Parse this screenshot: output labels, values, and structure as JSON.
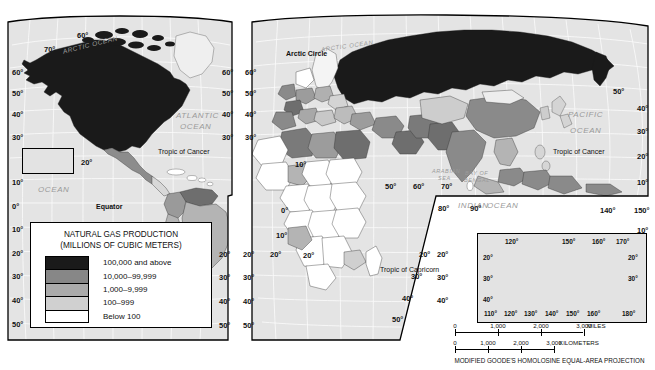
{
  "map": {
    "title": "NATURAL GAS PRODUCTION",
    "projection_note": "MODIFIED GOODE'S HOMOLOSINE EQUAL-AREA PROJECTION"
  },
  "legend": {
    "title": "NATURAL GAS PRODUCTION",
    "subtitle": "(MILLIONS OF CUBIC METERS)",
    "classes": [
      {
        "label": "100,000 and above",
        "color": "#1a1a1a"
      },
      {
        "label": "10,000–99,999",
        "color": "#878787"
      },
      {
        "label": "1,000–9,999",
        "color": "#ababab"
      },
      {
        "label": "100–999",
        "color": "#d0d0d0"
      },
      {
        "label": "Below 100",
        "color": "#ffffff"
      }
    ]
  },
  "scale": {
    "miles_ticks": [
      "0",
      "1,000",
      "2,000",
      "3,000"
    ],
    "miles_unit": "MILES",
    "km_ticks": [
      "0",
      "1,000",
      "2,000",
      "3,000"
    ],
    "km_unit": "KILOMETERS"
  },
  "ocean_labels": [
    {
      "text": "ARCTIC OCEAN",
      "x": 62,
      "y": 41,
      "size": 6.5,
      "rot": -14
    },
    {
      "text": "ATLANTIC",
      "x": 176,
      "y": 111,
      "size": 8,
      "rot": 0
    },
    {
      "text": "OCEAN",
      "x": 180,
      "y": 122,
      "size": 8,
      "rot": 0
    },
    {
      "text": "PACIFIC",
      "x": 38,
      "y": 163,
      "size": 8,
      "rot": 0
    },
    {
      "text": "OCEAN",
      "x": 38,
      "y": 185,
      "size": 8,
      "rot": 0
    },
    {
      "text": "ARCTIC OCEAN",
      "x": 321,
      "y": 43,
      "size": 6,
      "rot": -8
    },
    {
      "text": "PACIFIC",
      "x": 568,
      "y": 110,
      "size": 8,
      "rot": 0
    },
    {
      "text": "OCEAN",
      "x": 570,
      "y": 126,
      "size": 8,
      "rot": 0
    },
    {
      "text": "ARABIAN",
      "x": 432,
      "y": 168,
      "size": 5.5,
      "rot": 0
    },
    {
      "text": "SEA",
      "x": 438,
      "y": 175,
      "size": 5.5,
      "rot": 0
    },
    {
      "text": "BAY OF",
      "x": 465,
      "y": 170,
      "size": 5.5,
      "rot": 0
    },
    {
      "text": "BENGAL",
      "x": 464,
      "y": 177,
      "size": 5.5,
      "rot": 0
    },
    {
      "text": "INDIAN",
      "x": 458,
      "y": 201,
      "size": 8,
      "rot": 0
    },
    {
      "text": "OCEAN",
      "x": 487,
      "y": 201,
      "size": 8,
      "rot": 0
    },
    {
      "text": "CORAL  SEA",
      "x": 578,
      "y": 253,
      "size": 5.5,
      "rot": 0
    }
  ],
  "line_labels": [
    {
      "text": "Arctic Circle",
      "x": 286,
      "y": 50,
      "bold": true
    },
    {
      "text": "Tropic of Cancer",
      "x": 158,
      "y": 148,
      "bold": false
    },
    {
      "text": "Tropic of Cancer",
      "x": 553,
      "y": 148,
      "bold": false
    },
    {
      "text": "Equator",
      "x": 96,
      "y": 203,
      "bold": true
    },
    {
      "text": "Tropic of Capricorn",
      "x": 380,
      "y": 266,
      "bold": false
    }
  ],
  "graticule_ticks": [
    {
      "text": "60°",
      "x": 77,
      "y": 31
    },
    {
      "text": "70°",
      "x": 44,
      "y": 45
    },
    {
      "text": "60°",
      "x": 12,
      "y": 68
    },
    {
      "text": "50°",
      "x": 12,
      "y": 89
    },
    {
      "text": "40°",
      "x": 12,
      "y": 110
    },
    {
      "text": "30°",
      "x": 12,
      "y": 133
    },
    {
      "text": "20°",
      "x": 81,
      "y": 158
    },
    {
      "text": "160°",
      "x": 22,
      "y": 166
    },
    {
      "text": "10°",
      "x": 12,
      "y": 178
    },
    {
      "text": "0°",
      "x": 12,
      "y": 202
    },
    {
      "text": "10°",
      "x": 12,
      "y": 225
    },
    {
      "text": "20°",
      "x": 12,
      "y": 249
    },
    {
      "text": "30°",
      "x": 12,
      "y": 272
    },
    {
      "text": "40°",
      "x": 12,
      "y": 296
    },
    {
      "text": "50°",
      "x": 12,
      "y": 320
    },
    {
      "text": "60°",
      "x": 222,
      "y": 68
    },
    {
      "text": "50°",
      "x": 222,
      "y": 89
    },
    {
      "text": "40°",
      "x": 222,
      "y": 110
    },
    {
      "text": "30°",
      "x": 222,
      "y": 133
    },
    {
      "text": "20°",
      "x": 219,
      "y": 250
    },
    {
      "text": "30°",
      "x": 219,
      "y": 273
    },
    {
      "text": "40°",
      "x": 219,
      "y": 297
    },
    {
      "text": "50°",
      "x": 219,
      "y": 321
    },
    {
      "text": "60°",
      "x": 245,
      "y": 68
    },
    {
      "text": "50°",
      "x": 245,
      "y": 89
    },
    {
      "text": "40°",
      "x": 245,
      "y": 110
    },
    {
      "text": "30°",
      "x": 245,
      "y": 133
    },
    {
      "text": "20°",
      "x": 243,
      "y": 250
    },
    {
      "text": "30°",
      "x": 243,
      "y": 273
    },
    {
      "text": "40°",
      "x": 243,
      "y": 297
    },
    {
      "text": "50°",
      "x": 243,
      "y": 321
    },
    {
      "text": "0°",
      "x": 281,
      "y": 206
    },
    {
      "text": "10°",
      "x": 276,
      "y": 231
    },
    {
      "text": "20°",
      "x": 270,
      "y": 250
    },
    {
      "text": "10°",
      "x": 295,
      "y": 160
    },
    {
      "text": "50°",
      "x": 385,
      "y": 182
    },
    {
      "text": "60°",
      "x": 413,
      "y": 182
    },
    {
      "text": "70°",
      "x": 441,
      "y": 182
    },
    {
      "text": "80°",
      "x": 438,
      "y": 204
    },
    {
      "text": "90°",
      "x": 470,
      "y": 204
    },
    {
      "text": "140°",
      "x": 600,
      "y": 206
    },
    {
      "text": "150°",
      "x": 634,
      "y": 206
    },
    {
      "text": "50°",
      "x": 613,
      "y": 87
    },
    {
      "text": "40°",
      "x": 637,
      "y": 104
    },
    {
      "text": "30°",
      "x": 637,
      "y": 127
    },
    {
      "text": "20°",
      "x": 637,
      "y": 152
    },
    {
      "text": "10°",
      "x": 637,
      "y": 178
    },
    {
      "text": "10°",
      "x": 637,
      "y": 226
    },
    {
      "text": "20°",
      "x": 419,
      "y": 250
    },
    {
      "text": "30°",
      "x": 411,
      "y": 272
    },
    {
      "text": "40°",
      "x": 402,
      "y": 294
    },
    {
      "text": "50°",
      "x": 392,
      "y": 315
    },
    {
      "text": "20°",
      "x": 303,
      "y": 251
    },
    {
      "text": "20°",
      "x": 437,
      "y": 250
    },
    {
      "text": "30°",
      "x": 437,
      "y": 273
    },
    {
      "text": "40°",
      "x": 437,
      "y": 296
    }
  ],
  "australia_inset": {
    "lat_ticks_left": [
      "20°",
      "30°",
      "40°"
    ],
    "lat_ticks_right": [
      "20°",
      "30°"
    ],
    "lon_ticks_top": [
      "120°",
      "150°",
      "160°",
      "170°"
    ],
    "lon_ticks_bottom": [
      "110°",
      "120°",
      "130°",
      "140°",
      "150°",
      "160°",
      "180°"
    ]
  },
  "chart_data": {
    "type": "map",
    "title": "NATURAL GAS PRODUCTION",
    "unit": "MILLIONS OF CUBIC METERS",
    "classes": [
      "100,000 and above",
      "10,000–99,999",
      "1,000–9,999",
      "100–999",
      "Below 100"
    ],
    "regions": [
      {
        "name": "United States",
        "class": "100,000 and above"
      },
      {
        "name": "Canada",
        "class": "100,000 and above"
      },
      {
        "name": "Russia",
        "class": "100,000 and above"
      },
      {
        "name": "Mexico",
        "class": "10,000–99,999"
      },
      {
        "name": "Venezuela",
        "class": "10,000–99,999"
      },
      {
        "name": "Argentina",
        "class": "10,000–99,999"
      },
      {
        "name": "Brazil",
        "class": "1,000–9,999"
      },
      {
        "name": "Algeria",
        "class": "10,000–99,999"
      },
      {
        "name": "Libya",
        "class": "1,000–9,999"
      },
      {
        "name": "Egypt",
        "class": "10,000–99,999"
      },
      {
        "name": "Nigeria",
        "class": "1,000–9,999"
      },
      {
        "name": "Saudi Arabia",
        "class": "10,000–99,999"
      },
      {
        "name": "Iran",
        "class": "10,000–99,999"
      },
      {
        "name": "China",
        "class": "10,000–99,999"
      },
      {
        "name": "India",
        "class": "10,000–99,999"
      },
      {
        "name": "Indonesia",
        "class": "10,000–99,999"
      },
      {
        "name": "Australia",
        "class": "10,000–99,999"
      },
      {
        "name": "United Kingdom",
        "class": "10,000–99,999"
      },
      {
        "name": "Norway",
        "class": "10,000–99,999"
      },
      {
        "name": "Netherlands",
        "class": "10,000–99,999"
      },
      {
        "name": "Central Africa",
        "class": "Below 100"
      },
      {
        "name": "Sweden",
        "class": "Below 100"
      },
      {
        "name": "Finland",
        "class": "Below 100"
      }
    ]
  }
}
